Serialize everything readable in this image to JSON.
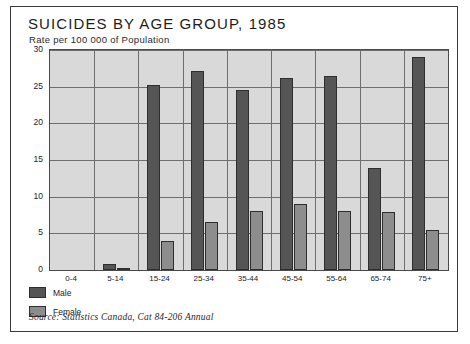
{
  "chart_data": {
    "type": "bar",
    "title": "SUICIDES  BY  AGE  GROUP, 1985",
    "subtitle": "Rate per 100 000 of Population",
    "xlabel": "",
    "ylabel": "",
    "ylim": [
      0,
      30
    ],
    "yticks": [
      0,
      5,
      10,
      15,
      20,
      25,
      30
    ],
    "grid": true,
    "legend_position": "below-left",
    "categories": [
      "0-4",
      "5-14",
      "15-24",
      "25-34",
      "35-44",
      "45-54",
      "55-64",
      "65-74",
      "75+"
    ],
    "series": [
      {
        "name": "Male",
        "color": "#555555",
        "values": [
          0,
          0.8,
          25.2,
          27.2,
          24.6,
          26.2,
          26.4,
          13.9,
          29.0
        ]
      },
      {
        "name": "Female",
        "color": "#8d8d8d",
        "values": [
          0,
          0.3,
          4.0,
          6.5,
          8.0,
          9.0,
          8.0,
          7.9,
          5.5
        ]
      }
    ],
    "source": "Source: Statistics Canada, Cat 84-206 Annual"
  }
}
